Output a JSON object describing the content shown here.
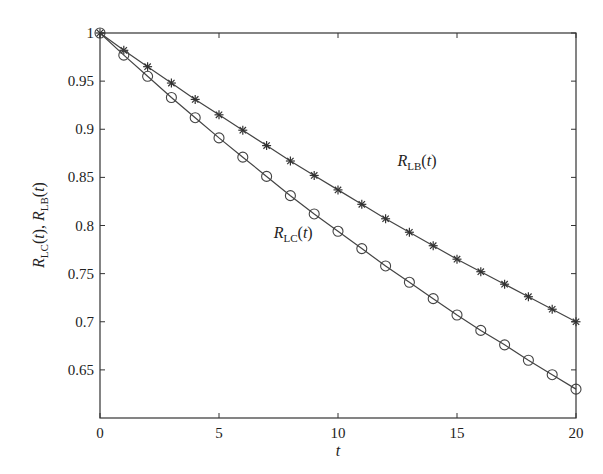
{
  "chart_data": {
    "type": "line",
    "title": "",
    "xlabel": "t",
    "ylabel": "R_LC(t), R_LB(t)",
    "xlim": [
      0,
      20
    ],
    "ylim": [
      0.6,
      1
    ],
    "xticks": [
      0,
      5,
      10,
      15,
      20
    ],
    "xtick_labels": [
      "0",
      "5",
      "10",
      "15",
      "20"
    ],
    "yticks": [
      0.65,
      0.7,
      0.75,
      0.8,
      0.85,
      0.9,
      0.95,
      1
    ],
    "ytick_labels": [
      "0.65",
      "0.7",
      "0.75",
      "0.8",
      "0.85",
      "0.9",
      "0.95",
      "1"
    ],
    "grid": false,
    "legend": "none",
    "x": [
      0,
      1,
      2,
      3,
      4,
      5,
      6,
      7,
      8,
      9,
      10,
      11,
      12,
      13,
      14,
      15,
      16,
      17,
      18,
      19,
      20
    ],
    "series": [
      {
        "name": "R_LB(t)",
        "marker": "star",
        "values": [
          1.0,
          0.982,
          0.965,
          0.948,
          0.931,
          0.915,
          0.899,
          0.883,
          0.867,
          0.852,
          0.837,
          0.822,
          0.807,
          0.793,
          0.779,
          0.765,
          0.752,
          0.739,
          0.726,
          0.713,
          0.7
        ],
        "annotation": {
          "main": "R",
          "sub": "LB",
          "suffix": "(t)",
          "at_x": 12.5,
          "at_y": 0.862
        }
      },
      {
        "name": "R_LC(t)",
        "marker": "circle",
        "values": [
          1.0,
          0.977,
          0.955,
          0.933,
          0.912,
          0.891,
          0.871,
          0.851,
          0.831,
          0.812,
          0.794,
          0.776,
          0.758,
          0.741,
          0.724,
          0.707,
          0.691,
          0.676,
          0.66,
          0.645,
          0.63
        ],
        "annotation": {
          "main": "R",
          "sub": "LC",
          "suffix": "(t)",
          "at_x": 7.3,
          "at_y": 0.787
        }
      }
    ]
  }
}
